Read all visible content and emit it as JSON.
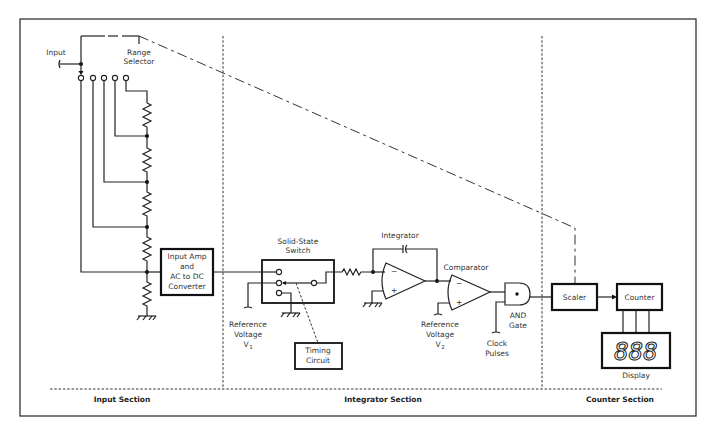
{
  "diagram": {
    "colors": {
      "line": "#222222",
      "background": "#ffffff",
      "frame": "#333333"
    },
    "sections": [
      {
        "id": "input",
        "label": "Input Section"
      },
      {
        "id": "integrator",
        "label": "Integrator Section"
      },
      {
        "id": "counter",
        "label": "Counter Section"
      }
    ],
    "labels": {
      "input": "Input",
      "range_selector_1": "Range",
      "range_selector_2": "Selector",
      "input_amp_1": "Input Amp",
      "input_amp_2": "and",
      "input_amp_3": "AC to DC",
      "input_amp_4": "Converter",
      "switch_1": "Solid-State",
      "switch_2": "Switch",
      "ref1_1": "Reference",
      "ref1_2": "Voltage",
      "ref1_3": "V",
      "ref1_sub": "1",
      "timing_1": "Timing",
      "timing_2": "Circuit",
      "integrator": "Integrator",
      "comparator": "Comparator",
      "ref2_1": "Reference",
      "ref2_2": "Voltage",
      "ref2_3": "V",
      "ref2_sub": "2",
      "and_1": "AND",
      "and_2": "Gate",
      "clock_1": "Clock",
      "clock_2": "Pulses",
      "scaler": "Scaler",
      "counter": "Counter",
      "display": "Display",
      "display_digits": "888",
      "minus": "−",
      "plus": "+"
    },
    "blocks": [
      {
        "id": "input-amp",
        "label": "Input Amp and AC to DC Converter"
      },
      {
        "id": "solid-state-switch",
        "label": "Solid-State Switch"
      },
      {
        "id": "timing-circuit",
        "label": "Timing Circuit"
      },
      {
        "id": "integrator",
        "label": "Integrator"
      },
      {
        "id": "comparator",
        "label": "Comparator"
      },
      {
        "id": "and-gate",
        "label": "AND Gate"
      },
      {
        "id": "scaler",
        "label": "Scaler"
      },
      {
        "id": "counter",
        "label": "Counter"
      },
      {
        "id": "display",
        "label": "Display"
      }
    ],
    "range_selector_positions": 5,
    "divider_resistors": 5
  }
}
